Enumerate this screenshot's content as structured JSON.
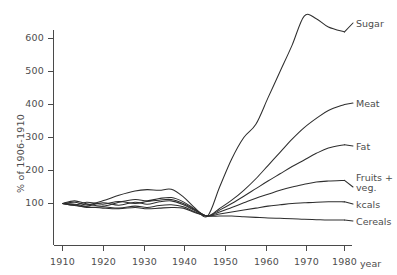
{
  "chart_data": {
    "type": "line",
    "title": "",
    "subtitle": "",
    "xlabel": "year",
    "ylabel": "% of 1906-1910",
    "xlim": [
      1906,
      1982
    ],
    "ylim": [
      40,
      700
    ],
    "grid": false,
    "legend_position": "right-inline-labels",
    "x_ticks": [
      1910,
      1920,
      1930,
      1940,
      1950,
      1960,
      1970,
      1980
    ],
    "x_tick_labels": [
      "1910",
      "1920",
      "1930",
      "1940",
      "1950",
      "1960",
      "1970",
      "1980"
    ],
    "y_ticks": [
      100,
      200,
      300,
      400,
      500,
      600
    ],
    "y_tick_labels": [
      "100",
      "200",
      "300",
      "400",
      "500",
      "600"
    ],
    "annotation": "All series converge to a common minimum around 1946 (post-war food shortage), then fan out.",
    "series": [
      {
        "name": "Sugar",
        "label": "Sugar",
        "color": "#2e2e2e",
        "x": [
          1910,
          1913,
          1916,
          1920,
          1924,
          1928,
          1931,
          1934,
          1937,
          1940,
          1943,
          1946,
          1949,
          1952,
          1955,
          1958,
          1961,
          1964,
          1967,
          1970,
          1973,
          1976,
          1980
        ],
        "values": [
          100,
          104,
          96,
          108,
          125,
          138,
          142,
          140,
          143,
          120,
          85,
          62,
          150,
          235,
          300,
          340,
          420,
          500,
          580,
          668,
          660,
          635,
          620
        ]
      },
      {
        "name": "Meat",
        "label": "Meat",
        "color": "#2e2e2e",
        "x": [
          1910,
          1913,
          1916,
          1920,
          1924,
          1928,
          1931,
          1934,
          1937,
          1940,
          1943,
          1946,
          1949,
          1952,
          1955,
          1958,
          1961,
          1964,
          1967,
          1970,
          1973,
          1976,
          1980
        ],
        "values": [
          100,
          108,
          99,
          92,
          104,
          112,
          108,
          115,
          118,
          105,
          82,
          62,
          85,
          110,
          140,
          175,
          215,
          255,
          295,
          330,
          358,
          382,
          400
        ]
      },
      {
        "name": "Fat",
        "label": "Fat",
        "color": "#2e2e2e",
        "x": [
          1910,
          1913,
          1916,
          1920,
          1924,
          1928,
          1931,
          1934,
          1937,
          1940,
          1943,
          1946,
          1949,
          1952,
          1955,
          1958,
          1961,
          1964,
          1967,
          1970,
          1973,
          1976,
          1980
        ],
        "values": [
          100,
          95,
          104,
          98,
          106,
          100,
          106,
          110,
          112,
          100,
          80,
          62,
          80,
          100,
          122,
          145,
          168,
          190,
          212,
          232,
          252,
          268,
          278
        ]
      },
      {
        "name": "Fruits + veg.",
        "label_line1": "Fruits +",
        "label_line2": "veg.",
        "color": "#2e2e2e",
        "x": [
          1910,
          1913,
          1916,
          1920,
          1924,
          1928,
          1931,
          1934,
          1937,
          1940,
          1943,
          1946,
          1949,
          1952,
          1955,
          1958,
          1961,
          1964,
          1967,
          1970,
          1973,
          1976,
          1980
        ],
        "values": [
          100,
          98,
          92,
          102,
          95,
          104,
          98,
          105,
          108,
          96,
          78,
          62,
          74,
          88,
          102,
          116,
          128,
          140,
          150,
          158,
          165,
          168,
          170
        ]
      },
      {
        "name": "kcals",
        "label": "kcals",
        "color": "#2e2e2e",
        "x": [
          1910,
          1913,
          1916,
          1920,
          1924,
          1928,
          1931,
          1934,
          1937,
          1940,
          1943,
          1946,
          1949,
          1952,
          1955,
          1958,
          1961,
          1964,
          1967,
          1970,
          1973,
          1976,
          1980
        ],
        "values": [
          100,
          96,
          88,
          90,
          86,
          92,
          88,
          94,
          96,
          90,
          74,
          62,
          68,
          74,
          80,
          86,
          92,
          96,
          100,
          102,
          104,
          105,
          105
        ]
      },
      {
        "name": "Cereals",
        "label": "Cereals",
        "color": "#2e2e2e",
        "x": [
          1910,
          1913,
          1916,
          1920,
          1924,
          1928,
          1931,
          1934,
          1937,
          1940,
          1943,
          1946,
          1949,
          1952,
          1955,
          1958,
          1961,
          1964,
          1967,
          1970,
          1973,
          1976,
          1980
        ],
        "values": [
          100,
          94,
          90,
          86,
          84,
          88,
          84,
          86,
          88,
          86,
          72,
          62,
          62,
          62,
          60,
          58,
          56,
          55,
          54,
          52,
          51,
          50,
          50
        ]
      }
    ]
  },
  "axes": {
    "y_label": "% of 1906-1910",
    "x_label": "year",
    "y_ticks": [
      "600",
      "500",
      "400",
      "300",
      "200",
      "100"
    ],
    "x_ticks": [
      "1910",
      "1920",
      "1930",
      "1940",
      "1950",
      "1960",
      "1970",
      "1980"
    ]
  },
  "series_labels": {
    "sugar": "Sugar",
    "meat": "Meat",
    "fat": "Fat",
    "fruits_veg_line1": "Fruits +",
    "fruits_veg_line2": "veg.",
    "kcals": "kcals",
    "cereals": "Cereals"
  },
  "colors": {
    "line": "#2e2e2e",
    "axis": "#4a4a4a",
    "text": "#4d4d4d",
    "background": "#ffffff"
  }
}
